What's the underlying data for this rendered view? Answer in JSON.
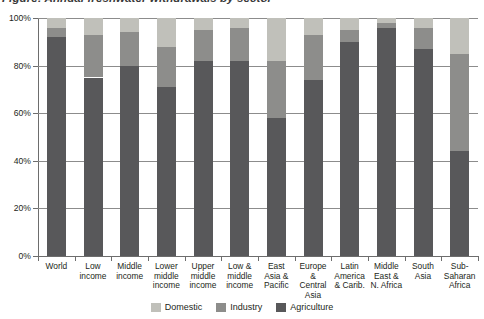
{
  "title": "Figure: Annual freshwater withdrawals by sector",
  "legend": {
    "position": "bottom-center",
    "items": [
      {
        "label": "Domestic",
        "color": "#c0c0ba",
        "key": "domestic"
      },
      {
        "label": "Industry",
        "color": "#8d8d8b",
        "key": "industry"
      },
      {
        "label": "Agriculture",
        "color": "#58585a",
        "key": "agriculture"
      }
    ]
  },
  "chart_data": {
    "type": "bar",
    "subtype": "stacked-100-percent",
    "title": "",
    "xlabel": "",
    "ylabel": "",
    "ylim": [
      0,
      100
    ],
    "yticks": [
      0,
      20,
      40,
      60,
      80,
      100
    ],
    "ytick_labels": [
      "0%",
      "20%",
      "40%",
      "60%",
      "80%",
      "100%"
    ],
    "grid": true,
    "grid_axis": "y",
    "legend_position": "bottom-center",
    "categories": [
      "World",
      "Low income",
      "Middle income",
      "Lower middle income",
      "Upper middle income",
      "Low & middle income",
      "East Asia & Pacific",
      "Europe & Central Asia",
      "Latin America & Carib.",
      "Middle East & N. Africa",
      "South Asia",
      "Sub-Saharan Africa"
    ],
    "category_label_lines": [
      [
        "World"
      ],
      [
        "Low",
        "income"
      ],
      [
        "Middle",
        "income"
      ],
      [
        "Lower",
        "middle",
        "income"
      ],
      [
        "Upper",
        "middle",
        "income"
      ],
      [
        "Low &",
        "middle",
        "income"
      ],
      [
        "East",
        "Asia &",
        "Pacific"
      ],
      [
        "Europe",
        "&",
        "Central",
        "Asia"
      ],
      [
        "Latin",
        "America",
        "& Carib."
      ],
      [
        "Middle",
        "East &",
        "N. Africa"
      ],
      [
        "South",
        "Asia"
      ],
      [
        "Sub-",
        "Saharan",
        "Africa"
      ]
    ],
    "series": [
      {
        "name": "Agriculture",
        "color": "#58585a",
        "values": [
          92,
          75,
          80,
          71,
          82,
          82,
          58,
          74,
          90,
          96,
          87,
          44
        ]
      },
      {
        "name": "Industry",
        "color": "#8d8d8b",
        "values": [
          4,
          18,
          14,
          17,
          13,
          14,
          24,
          19,
          5,
          2,
          9,
          41
        ]
      },
      {
        "name": "Domestic",
        "color": "#c0c0ba",
        "values": [
          4,
          7,
          6,
          12,
          5,
          4,
          18,
          7,
          5,
          2,
          4,
          15
        ]
      }
    ],
    "cumulative_tops": {
      "agriculture": [
        92,
        75,
        80,
        71,
        82,
        82,
        58,
        74,
        90,
        96,
        87,
        44
      ],
      "industry": [
        96,
        93,
        94,
        88,
        95,
        96,
        82,
        93,
        95,
        98,
        96,
        85
      ],
      "domestic": [
        100,
        100,
        100,
        100,
        100,
        100,
        100,
        100,
        100,
        100,
        100,
        100
      ]
    }
  }
}
